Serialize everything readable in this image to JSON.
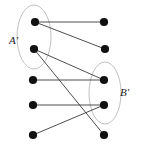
{
  "figure": {
    "type": "bipartite-graph-diagram",
    "width": 141,
    "height": 149,
    "background_color": "#ffffff",
    "node_color": "#111111",
    "edge_color": "#3a3a3a",
    "ellipse_color": "#b9b9b9",
    "node_radius": 4.1,
    "edge_width": 0.9,
    "ellipse_width": 0.9
  },
  "labels": {
    "left_set": "A'",
    "right_set": "B'"
  },
  "label_positions": {
    "left_set": {
      "x": 9,
      "y": 44
    },
    "right_set": {
      "x": 120,
      "y": 96
    }
  },
  "nodes": {
    "left": [
      {
        "id": "L1",
        "x": 35,
        "y": 22
      },
      {
        "id": "L2",
        "x": 34,
        "y": 49
      },
      {
        "id": "L3",
        "x": 33,
        "y": 80
      },
      {
        "id": "L4",
        "x": 33,
        "y": 105
      },
      {
        "id": "L5",
        "x": 33,
        "y": 135
      }
    ],
    "right": [
      {
        "id": "R1",
        "x": 104,
        "y": 22
      },
      {
        "id": "R2",
        "x": 105,
        "y": 49
      },
      {
        "id": "R3",
        "x": 104,
        "y": 80
      },
      {
        "id": "R4",
        "x": 104,
        "y": 105
      },
      {
        "id": "R5",
        "x": 104,
        "y": 135
      }
    ]
  },
  "edges": [
    {
      "id": "E1",
      "from": "L1",
      "to": "R1",
      "x1": 35,
      "y1": 22,
      "x2": 104,
      "y2": 22
    },
    {
      "id": "E2",
      "from": "L1",
      "to": "R2",
      "x1": 35,
      "y1": 22,
      "x2": 105,
      "y2": 49
    },
    {
      "id": "E3",
      "from": "L2",
      "to": "R3",
      "x1": 34,
      "y1": 49,
      "x2": 104,
      "y2": 80
    },
    {
      "id": "E4",
      "from": "L2",
      "to": "R5",
      "x1": 34,
      "y1": 49,
      "x2": 104,
      "y2": 135
    },
    {
      "id": "E5",
      "from": "L3",
      "to": "R3",
      "x1": 33,
      "y1": 80,
      "x2": 104,
      "y2": 80
    },
    {
      "id": "E6",
      "from": "L4",
      "to": "R4",
      "x1": 33,
      "y1": 105,
      "x2": 104,
      "y2": 105
    },
    {
      "id": "E7",
      "from": "L5",
      "to": "R4",
      "x1": 33,
      "y1": 135,
      "x2": 104,
      "y2": 105
    }
  ],
  "ellipses": [
    {
      "id": "left-set-ellipse",
      "cx": 34,
      "cy": 37,
      "rx": 17,
      "ry": 32
    },
    {
      "id": "right-set-ellipse",
      "cx": 105,
      "cy": 93,
      "rx": 16,
      "ry": 31
    }
  ]
}
